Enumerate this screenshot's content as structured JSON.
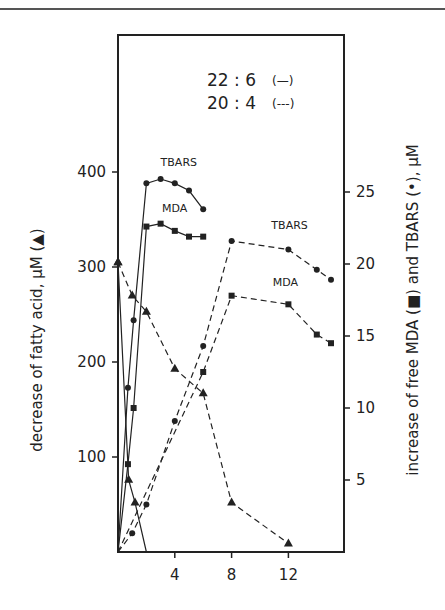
{
  "chart_data": {
    "type": "line",
    "title": "",
    "legend": [
      {
        "label": "22 : 6",
        "style_label": "(—)",
        "linestyle": "solid"
      },
      {
        "label": "20 : 4",
        "style_label": "(---)",
        "linestyle": "dashed"
      }
    ],
    "legend_position": "top-right",
    "xlabel": "",
    "ylabel_left": "decrease of fatty acid, µM (▲)",
    "ylabel_right": "increase of free MDA (■) and TBARS (•), µM",
    "x_ticks": [
      "4",
      "8",
      "12"
    ],
    "x_tick_values": [
      4,
      8,
      12
    ],
    "y_left_ticks": [
      "100",
      "200",
      "300",
      "400"
    ],
    "y_left_tick_values": [
      100,
      200,
      300,
      400
    ],
    "y_right_ticks": [
      "5",
      "10",
      "15",
      "20",
      "25"
    ],
    "y_right_tick_values": [
      5,
      10,
      15,
      20,
      25
    ],
    "xlim": [
      0,
      16
    ],
    "ylim_left": [
      0,
      400
    ],
    "ylim_right": [
      0,
      25
    ],
    "grid": false,
    "annotations": [
      {
        "text": "TBARS",
        "near_series": "22:6 TBARS"
      },
      {
        "text": "MDA",
        "near_series": "22:6 MDA"
      },
      {
        "text": "TBARS",
        "near_series": "20:4 TBARS"
      },
      {
        "text": "MDA",
        "near_series": "20:4 MDA"
      }
    ],
    "series": [
      {
        "name": "22:6 fatty acid decrease",
        "axis": "left",
        "marker": "triangle",
        "linestyle": "solid",
        "x": [
          0,
          0.75,
          1.2,
          2
        ],
        "y": [
          305,
          76,
          52,
          0
        ],
        "marker_mask": [
          1,
          1,
          1,
          0
        ]
      },
      {
        "name": "20:4 fatty acid decrease",
        "axis": "left",
        "marker": "triangle",
        "linestyle": "dashed",
        "x": [
          0,
          1,
          2,
          4,
          6,
          8,
          12
        ],
        "y": [
          305,
          270,
          253,
          193,
          167,
          52,
          9
        ]
      },
      {
        "name": "22:6 TBARS",
        "axis": "right",
        "marker": "circle",
        "linestyle": "solid",
        "x": [
          0,
          0.7,
          1.1,
          2,
          3,
          4,
          5,
          6
        ],
        "y": [
          0,
          11.4,
          16.1,
          25.6,
          25.9,
          25.6,
          25.1,
          23.8
        ],
        "marker_mask": [
          0,
          1,
          1,
          1,
          1,
          1,
          1,
          1
        ]
      },
      {
        "name": "22:6 MDA",
        "axis": "right",
        "marker": "square",
        "linestyle": "solid",
        "x": [
          0,
          0.7,
          1.1,
          2,
          3,
          4,
          5,
          6
        ],
        "y": [
          0,
          6.1,
          10.0,
          22.6,
          22.8,
          22.3,
          21.9,
          21.9
        ],
        "marker_mask": [
          0,
          1,
          1,
          1,
          1,
          1,
          1,
          1
        ]
      },
      {
        "name": "20:4 TBARS",
        "axis": "right",
        "marker": "circle",
        "linestyle": "dashed",
        "x": [
          0,
          1,
          2,
          4,
          6,
          8,
          12,
          14,
          15
        ],
        "y": [
          0,
          1.3,
          3.3,
          9.1,
          14.3,
          21.6,
          21.0,
          19.6,
          18.9
        ],
        "marker_mask": [
          0,
          1,
          1,
          1,
          1,
          1,
          1,
          1,
          1
        ]
      },
      {
        "name": "20:4 MDA",
        "axis": "right",
        "marker": "square",
        "linestyle": "dashed",
        "x": [
          0,
          6,
          8,
          12,
          14,
          15
        ],
        "y": [
          0,
          12.5,
          17.8,
          17.2,
          15.1,
          14.5
        ],
        "marker_mask": [
          0,
          1,
          1,
          1,
          1,
          1
        ]
      }
    ]
  }
}
